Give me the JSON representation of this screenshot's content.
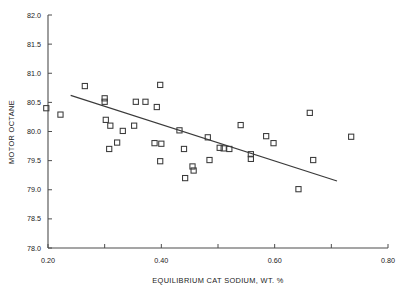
{
  "chart_data": {
    "type": "scatter",
    "title": "",
    "xlabel": "EQUILIBRIUM CAT SODIUM, WT. %",
    "ylabel": "MOTOR OCTANE",
    "xlim": [
      0.2,
      0.8
    ],
    "ylim": [
      78.0,
      82.0
    ],
    "grid": false,
    "legend": null,
    "xticks": [
      0.2,
      0.3,
      0.4,
      0.5,
      0.6,
      0.7,
      0.8
    ],
    "xtick_labels": [
      "0.20",
      "",
      "0.40",
      "",
      "0.60",
      "",
      "0.80"
    ],
    "yticks": [
      78.0,
      78.5,
      79.0,
      79.5,
      80.0,
      80.5,
      81.0,
      81.5,
      82.0
    ],
    "ytick_labels": [
      "78.0",
      "78.5",
      "79.0",
      "79.5",
      "80.0",
      "80.5",
      "81.0",
      "81.5",
      "82.0"
    ],
    "marker": "open-square",
    "points": [
      {
        "x": 0.197,
        "y": 80.4
      },
      {
        "x": 0.222,
        "y": 80.29
      },
      {
        "x": 0.265,
        "y": 80.78
      },
      {
        "x": 0.3,
        "y": 80.57
      },
      {
        "x": 0.3,
        "y": 80.51
      },
      {
        "x": 0.302,
        "y": 80.2
      },
      {
        "x": 0.31,
        "y": 80.1
      },
      {
        "x": 0.308,
        "y": 79.7
      },
      {
        "x": 0.322,
        "y": 79.81
      },
      {
        "x": 0.332,
        "y": 80.01
      },
      {
        "x": 0.352,
        "y": 80.1
      },
      {
        "x": 0.355,
        "y": 80.51
      },
      {
        "x": 0.372,
        "y": 80.51
      },
      {
        "x": 0.392,
        "y": 80.42
      },
      {
        "x": 0.398,
        "y": 80.8
      },
      {
        "x": 0.388,
        "y": 79.8
      },
      {
        "x": 0.4,
        "y": 79.79
      },
      {
        "x": 0.398,
        "y": 79.49
      },
      {
        "x": 0.432,
        "y": 80.02
      },
      {
        "x": 0.44,
        "y": 79.7
      },
      {
        "x": 0.442,
        "y": 79.2
      },
      {
        "x": 0.455,
        "y": 79.4
      },
      {
        "x": 0.457,
        "y": 79.33
      },
      {
        "x": 0.482,
        "y": 79.9
      },
      {
        "x": 0.485,
        "y": 79.51
      },
      {
        "x": 0.503,
        "y": 79.72
      },
      {
        "x": 0.51,
        "y": 79.71
      },
      {
        "x": 0.52,
        "y": 79.7
      },
      {
        "x": 0.54,
        "y": 80.11
      },
      {
        "x": 0.558,
        "y": 79.61
      },
      {
        "x": 0.558,
        "y": 79.53
      },
      {
        "x": 0.585,
        "y": 79.92
      },
      {
        "x": 0.598,
        "y": 79.8
      },
      {
        "x": 0.642,
        "y": 79.01
      },
      {
        "x": 0.662,
        "y": 80.32
      },
      {
        "x": 0.668,
        "y": 79.51
      },
      {
        "x": 0.735,
        "y": 79.91
      }
    ],
    "fit_line": {
      "label": "regression-line",
      "x_start": 0.24,
      "y_start": 80.62,
      "x_end": 0.71,
      "y_end": 79.15
    }
  }
}
